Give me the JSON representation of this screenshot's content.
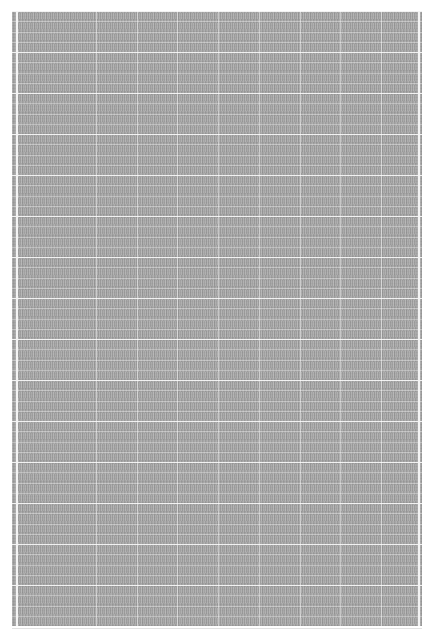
{
  "document": {
    "type": "dense text grid / spreadsheet (downscaled, text illegible)",
    "cell_text_legible": false
  },
  "grid": {
    "panel": {
      "left": 12,
      "top": 11,
      "width": 410,
      "height": 615,
      "color": "#a6a6a6"
    },
    "row_height": 10.25,
    "row_count": 60,
    "strong_rule_every_rows": 4,
    "column_dividers_x": [
      4,
      84,
      125,
      165,
      206,
      247,
      288,
      328,
      369,
      406
    ],
    "edge_dividers_x": [
      4,
      406
    ],
    "rule_color": "#ffffff"
  }
}
